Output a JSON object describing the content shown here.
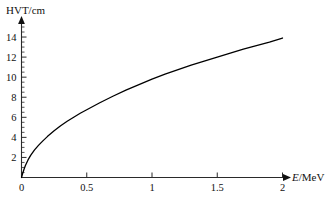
{
  "chart_data": {
    "type": "line",
    "title": "",
    "subtitle": "",
    "xlabel": "E/MeV",
    "xlabel_italic_part": "E",
    "xlabel_rest": "/MeV",
    "ylabel": "HVT/cm",
    "xlim": [
      0,
      2
    ],
    "ylim": [
      0,
      15
    ],
    "xticks": [
      0,
      0.5,
      1,
      1.5,
      2
    ],
    "xticklabels": [
      "0",
      "0.5",
      "1",
      "1.5",
      "2"
    ],
    "yticks": [
      0,
      2,
      4,
      6,
      8,
      10,
      12,
      14
    ],
    "yticklabels": [
      "0",
      "2",
      "4",
      "6",
      "8",
      "10",
      "12",
      "14"
    ],
    "y_minor_tick_step": 0.5,
    "grid": false,
    "legend": null,
    "axis_arrows": true,
    "line_color": "#000000",
    "axis_color": "#2a2a2a",
    "series": [
      {
        "name": "HVT",
        "x": [
          0.0,
          0.01,
          0.02,
          0.03,
          0.05,
          0.07,
          0.1,
          0.13,
          0.16,
          0.2,
          0.25,
          0.3,
          0.35,
          0.4,
          0.45,
          0.5,
          0.6,
          0.7,
          0.8,
          0.9,
          1.0,
          1.1,
          1.2,
          1.3,
          1.4,
          1.5,
          1.6,
          1.7,
          1.8,
          1.9,
          2.0
        ],
        "y": [
          0.0,
          0.45,
          0.85,
          1.2,
          1.75,
          2.2,
          2.75,
          3.2,
          3.6,
          4.1,
          4.65,
          5.15,
          5.6,
          6.0,
          6.4,
          6.75,
          7.45,
          8.1,
          8.7,
          9.25,
          9.8,
          10.3,
          10.75,
          11.2,
          11.6,
          12.0,
          12.4,
          12.8,
          13.15,
          13.5,
          13.9
        ]
      }
    ]
  },
  "figure": {
    "y_axis_name": "HVT/cm",
    "x_axis_name": "E/MeV"
  }
}
